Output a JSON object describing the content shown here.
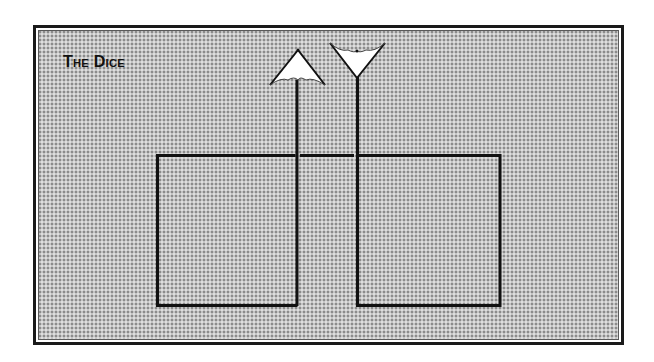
{
  "diagram": {
    "title": "The Dice",
    "colors": {
      "line": "#111111",
      "background_fill": "#c4c4c4",
      "arrowhead_fill": "#ffffff"
    },
    "elements": {
      "left_box": {
        "label": "left-box"
      },
      "right_box": {
        "label": "right-box"
      },
      "up_arrow": {
        "direction": "up",
        "icon": "umbrella-arrowhead-icon"
      },
      "down_arrow": {
        "direction": "down",
        "icon": "cup-arrowhead-icon"
      }
    }
  }
}
